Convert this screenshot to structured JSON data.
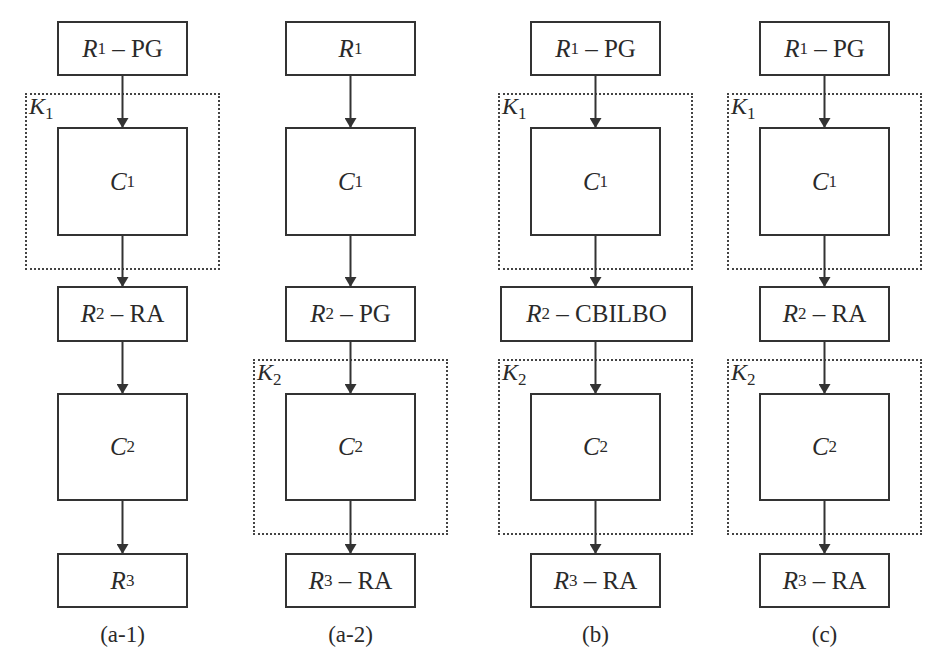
{
  "figure": {
    "columns": [
      {
        "id": "a-1",
        "caption": "(a-1)",
        "boxes": [
          {
            "key": "r1",
            "sym": "R",
            "sub": "1",
            "suffix": " – PG"
          },
          {
            "key": "c1",
            "sym": "C",
            "sub": "1",
            "suffix": ""
          },
          {
            "key": "r2",
            "sym": "R",
            "sub": "2",
            "suffix": " – RA"
          },
          {
            "key": "c2",
            "sym": "C",
            "sub": "2",
            "suffix": ""
          },
          {
            "key": "r3",
            "sym": "R",
            "sub": "3",
            "suffix": ""
          }
        ],
        "groups": [
          {
            "sym": "K",
            "sub": "1",
            "wraps": "c1"
          }
        ]
      },
      {
        "id": "a-2",
        "caption": "(a-2)",
        "boxes": [
          {
            "key": "r1",
            "sym": "R",
            "sub": "1",
            "suffix": ""
          },
          {
            "key": "c1",
            "sym": "C",
            "sub": "1",
            "suffix": ""
          },
          {
            "key": "r2",
            "sym": "R",
            "sub": "2",
            "suffix": " – PG"
          },
          {
            "key": "c2",
            "sym": "C",
            "sub": "2",
            "suffix": ""
          },
          {
            "key": "r3",
            "sym": "R",
            "sub": "3",
            "suffix": " – RA"
          }
        ],
        "groups": [
          {
            "sym": "K",
            "sub": "2",
            "wraps": "c2"
          }
        ]
      },
      {
        "id": "b",
        "caption": "(b)",
        "boxes": [
          {
            "key": "r1",
            "sym": "R",
            "sub": "1",
            "suffix": " – PG"
          },
          {
            "key": "c1",
            "sym": "C",
            "sub": "1",
            "suffix": ""
          },
          {
            "key": "r2",
            "sym": "R",
            "sub": "2",
            "suffix": " – CBILBO"
          },
          {
            "key": "c2",
            "sym": "C",
            "sub": "2",
            "suffix": ""
          },
          {
            "key": "r3",
            "sym": "R",
            "sub": "3",
            "suffix": " – RA"
          }
        ],
        "groups": [
          {
            "sym": "K",
            "sub": "1",
            "wraps": "c1"
          },
          {
            "sym": "K",
            "sub": "2",
            "wraps": "c2"
          }
        ]
      },
      {
        "id": "c",
        "caption": "(c)",
        "boxes": [
          {
            "key": "r1",
            "sym": "R",
            "sub": "1",
            "suffix": " – PG"
          },
          {
            "key": "c1",
            "sym": "C",
            "sub": "1",
            "suffix": ""
          },
          {
            "key": "r2",
            "sym": "R",
            "sub": "2",
            "suffix": " – RA"
          },
          {
            "key": "c2",
            "sym": "C",
            "sub": "2",
            "suffix": ""
          },
          {
            "key": "r3",
            "sym": "R",
            "sub": "3",
            "suffix": " – RA"
          }
        ],
        "groups": [
          {
            "sym": "K",
            "sub": "1",
            "wraps": "c1"
          },
          {
            "sym": "K",
            "sub": "2",
            "wraps": "c2"
          }
        ]
      }
    ],
    "colors": {
      "stroke": "#333333",
      "background": "#ffffff"
    }
  }
}
